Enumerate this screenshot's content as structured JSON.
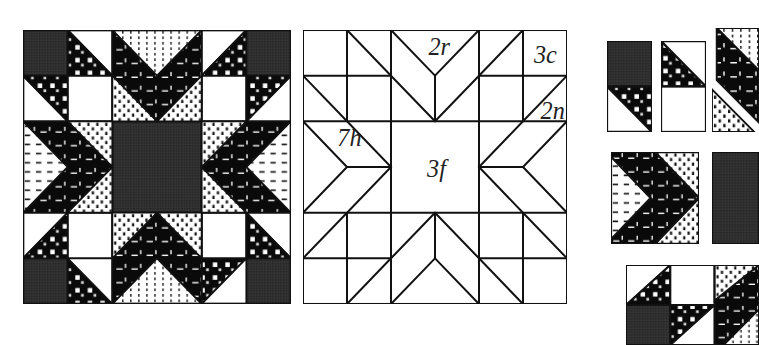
{
  "figure": {
    "colors": {
      "dark": "#2b2b2b",
      "black": "#0a0a0a",
      "white": "#ffffff",
      "line": "#111111"
    }
  },
  "colored_block": {
    "name": "Finished block",
    "grid": 6,
    "fabrics": [
      "dark solid",
      "black print with white dashes",
      "white with dotted print",
      "black with white checks",
      "white with dashes",
      "white"
    ]
  },
  "line_diagram": {
    "name": "Piecing template diagram",
    "labels": [
      {
        "id": "2r",
        "text": "2r",
        "x": 3.25,
        "y": 0.62
      },
      {
        "id": "3c",
        "text": "3c",
        "x": 5.25,
        "y": 0.78
      },
      {
        "id": "2n",
        "text": "2n",
        "x": 5.55,
        "y": 1.95
      },
      {
        "id": "7h",
        "text": "7h",
        "x": 1.0,
        "y": 2.55
      },
      {
        "id": "3f",
        "text": "3f",
        "x": 3.0,
        "y": 3.15
      }
    ]
  },
  "assembly": {
    "name": "Unit assembly pieces",
    "units": [
      "corner unit A",
      "corner unit B",
      "diagonal strip",
      "chevron unit",
      "center square",
      "corner four-patch"
    ]
  }
}
